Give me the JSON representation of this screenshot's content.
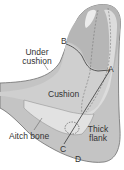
{
  "diagram": {
    "colors": {
      "background": "#ffffff",
      "meat_dark": "#a9a9a9",
      "meat_mid": "#c4c4c4",
      "meat_light": "#dcdcdc",
      "fat_highlight": "#ececec",
      "outline": "#6e6e6e",
      "cut_line": "#3a3a3a",
      "text": "#333333"
    },
    "labels": {
      "under_cushion_line1": "Under",
      "under_cushion_line2": "cushion",
      "cushion": "Cushion",
      "aitch_bone": "Aitch bone",
      "thick_flank_line1": "Thick",
      "thick_flank_line2": "flank"
    },
    "cut_points": {
      "a": "A",
      "b": "B",
      "c": "C",
      "d": "D"
    }
  }
}
